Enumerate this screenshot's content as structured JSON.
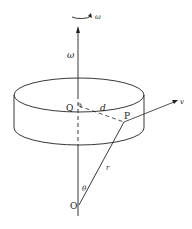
{
  "diagram": {
    "type": "rotating disc geometry",
    "labels": {
      "rotation_omega": "ω",
      "axis_omega": "ω",
      "point_q": "Q",
      "distance_d": "d",
      "point_p": "P",
      "velocity_v": "v",
      "radius_r": "r",
      "angle_theta": "θ",
      "origin_o": "O"
    },
    "colors": {
      "line": "#222222",
      "background": "#ffffff"
    }
  }
}
